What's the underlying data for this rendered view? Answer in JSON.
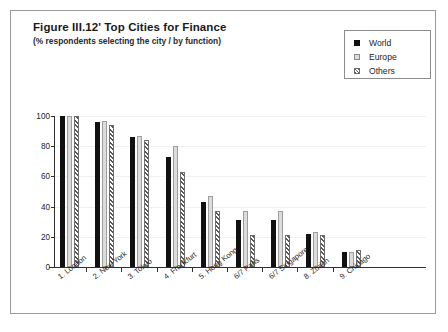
{
  "figure": {
    "title": "Figure III.12'  Top Cities for Finance",
    "subtitle": "(% respondents selecting the city / by function)"
  },
  "legend": {
    "position": "top-right",
    "entries": [
      {
        "label": "World",
        "marker": "solid-square-icon",
        "color": "#111111"
      },
      {
        "label": "Europe",
        "marker": "light-square-icon",
        "color": "#dcdcdc"
      },
      {
        "label": "Others",
        "marker": "hatched-square-icon",
        "color": "#585858"
      }
    ]
  },
  "chart_data": {
    "type": "bar",
    "title": "Figure III.12'  Top Cities for Finance",
    "subtitle": "(% respondents selecting the city / by function)",
    "xlabel": "",
    "ylabel": "",
    "ylim": [
      0,
      100
    ],
    "yticks": [
      0,
      20,
      40,
      60,
      80,
      100
    ],
    "ytick_labels": [
      "0",
      "20",
      "40",
      "60",
      "80",
      "100"
    ],
    "grid": true,
    "legend_position": "top-right",
    "categories": [
      "1. London",
      "2. New York",
      "3. Tokyo",
      "4. Frankfurt",
      "5. Hong Kong",
      "6/7 Paris",
      "6/7 Singapore",
      "8. Zürich",
      "9. Chicago"
    ],
    "series": [
      {
        "name": "World",
        "values": [
          100,
          96,
          86,
          73,
          43,
          31,
          31,
          22,
          10
        ]
      },
      {
        "name": "Europe",
        "values": [
          100,
          97,
          87,
          80,
          47,
          37,
          37,
          23,
          10
        ]
      },
      {
        "name": "Others",
        "values": [
          100,
          94,
          84,
          63,
          37,
          21,
          21,
          21,
          11
        ]
      }
    ]
  }
}
